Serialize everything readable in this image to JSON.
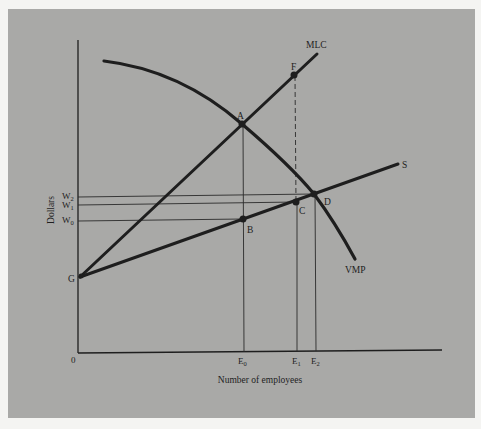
{
  "figure": {
    "x_axis_label": "Number of employees",
    "y_axis_label": "Dollars",
    "origin_label": "0",
    "curves": {
      "mlc": "MLC",
      "supply": "S",
      "vmp": "VMP"
    },
    "points": {
      "a": "A",
      "b": "B",
      "c": "C",
      "d": "D",
      "f": "F",
      "g": "G"
    },
    "y_ticks": {
      "w2": {
        "base": "W",
        "sub": "2"
      },
      "w1": {
        "base": "W",
        "sub": "1"
      },
      "w0": {
        "base": "W",
        "sub": "0"
      }
    },
    "x_ticks": {
      "e0": {
        "base": "E",
        "sub": "0"
      },
      "e1": {
        "base": "E",
        "sub": "1"
      },
      "e2": {
        "base": "E",
        "sub": "2"
      }
    }
  },
  "colors": {
    "panel": "#a9a9a7",
    "ink": "#1e1e1e",
    "border": "#f4f4f2"
  }
}
